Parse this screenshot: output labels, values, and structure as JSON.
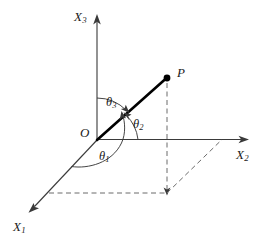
{
  "figure": {
    "background_color": "#ffffff",
    "axis_color": "#3a3a3a",
    "vector_color": "#000000",
    "dashed_color": "#6b6b6b"
  },
  "axes": [
    {
      "name": "x1-axis",
      "label_base": "X",
      "label_sub": "1",
      "label": "X₁"
    },
    {
      "name": "x2-axis",
      "label_base": "X",
      "label_sub": "2",
      "label": "X₂"
    },
    {
      "name": "x3-axis",
      "label_base": "X",
      "label_sub": "3",
      "label": "X₃"
    }
  ],
  "points": [
    {
      "name": "origin",
      "label": "O"
    },
    {
      "name": "point-p",
      "label": "P"
    }
  ],
  "angles": [
    {
      "name": "theta1",
      "symbol": "θ",
      "sub": "1",
      "label": "θ₁",
      "measured_from": "X1"
    },
    {
      "name": "theta2",
      "symbol": "θ",
      "sub": "2",
      "label": "θ₂",
      "measured_from": "X2"
    },
    {
      "name": "theta3",
      "symbol": "θ",
      "sub": "3",
      "label": "θ₃",
      "measured_from": "X3"
    }
  ],
  "labels": {
    "x1": {
      "base": "X",
      "sub": "1"
    },
    "x2": {
      "base": "X",
      "sub": "2"
    },
    "x3": {
      "base": "X",
      "sub": "3"
    },
    "origin": "O",
    "p": "P",
    "theta1": {
      "base": "θ",
      "sub": "1"
    },
    "theta2": {
      "base": "θ",
      "sub": "2"
    },
    "theta3": {
      "base": "θ",
      "sub": "3"
    }
  }
}
